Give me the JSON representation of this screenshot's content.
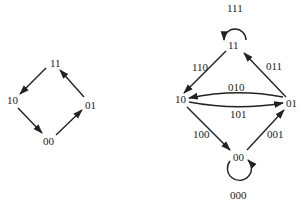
{
  "diagrams": [
    {
      "name": "2-bit state graph",
      "nodes": [
        {
          "id": "11",
          "label": "11"
        },
        {
          "id": "10",
          "label": "10"
        },
        {
          "id": "01",
          "label": "01"
        },
        {
          "id": "00",
          "label": "00"
        }
      ],
      "edges": [
        {
          "from": "11",
          "to": "10"
        },
        {
          "from": "10",
          "to": "00"
        },
        {
          "from": "00",
          "to": "01"
        },
        {
          "from": "01",
          "to": "11"
        }
      ]
    },
    {
      "name": "de Bruijn graph",
      "nodes": [
        {
          "id": "11",
          "label": "11"
        },
        {
          "id": "10",
          "label": "10"
        },
        {
          "id": "01",
          "label": "01"
        },
        {
          "id": "00",
          "label": "00"
        }
      ],
      "edges": [
        {
          "from": "11",
          "to": "11",
          "label": "111"
        },
        {
          "from": "11",
          "to": "10",
          "label": "110"
        },
        {
          "from": "01",
          "to": "11",
          "label": "011"
        },
        {
          "from": "01",
          "to": "10",
          "label": "010"
        },
        {
          "from": "10",
          "to": "01",
          "label": "101"
        },
        {
          "from": "10",
          "to": "00",
          "label": "100"
        },
        {
          "from": "00",
          "to": "01",
          "label": "001"
        },
        {
          "from": "00",
          "to": "00",
          "label": "000"
        }
      ]
    }
  ],
  "colors": {
    "stroke": "#222222",
    "background": "#ffffff"
  }
}
